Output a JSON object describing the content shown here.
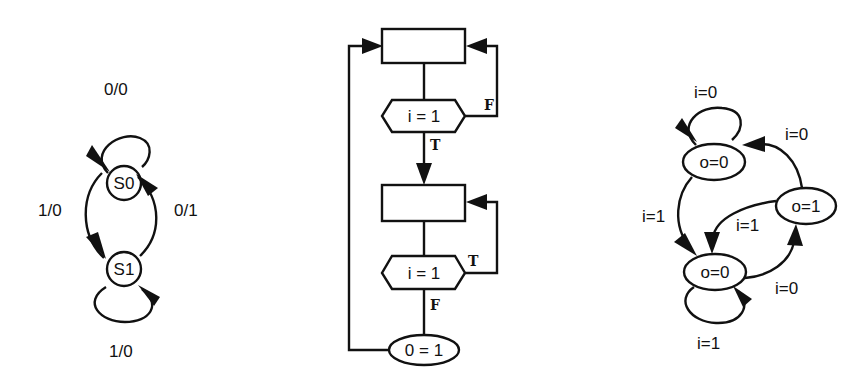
{
  "diagrams": {
    "mealy": {
      "states": [
        {
          "id": "S0",
          "label": "S0"
        },
        {
          "id": "S1",
          "label": "S1"
        }
      ],
      "transitions": [
        {
          "from": "S0",
          "to": "S0",
          "label": "0/0"
        },
        {
          "from": "S1",
          "to": "S0",
          "label": "0/1"
        },
        {
          "from": "S0",
          "to": "S1",
          "label": "1/0"
        },
        {
          "from": "S1",
          "to": "S1",
          "label": "1/0"
        }
      ]
    },
    "flowchart": {
      "decision1": {
        "label": "i = 1",
        "true_label": "T",
        "false_label": "F"
      },
      "decision2": {
        "label": "i = 1",
        "true_label": "T",
        "false_label": "F"
      },
      "output": {
        "label": "0 = 1"
      }
    },
    "moore": {
      "states": [
        {
          "id": "A",
          "label": "o=0"
        },
        {
          "id": "B",
          "label": "o=1"
        },
        {
          "id": "C",
          "label": "o=0"
        }
      ],
      "transitions": [
        {
          "from": "A",
          "to": "A",
          "label": "i=0"
        },
        {
          "from": "B",
          "to": "A",
          "label": "i=0"
        },
        {
          "from": "A",
          "to": "C",
          "label": "i=1"
        },
        {
          "from": "B",
          "to": "C",
          "label": "i=1"
        },
        {
          "from": "C",
          "to": "B",
          "label": "i=0"
        },
        {
          "from": "C",
          "to": "C",
          "label": "i=1"
        }
      ]
    }
  }
}
